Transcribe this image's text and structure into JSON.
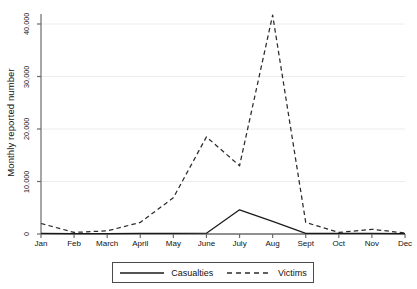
{
  "chart_data": {
    "type": "line",
    "title": "",
    "xlabel": "",
    "ylabel": "Monthly reported number",
    "categories": [
      "Jan",
      "Feb",
      "March",
      "April",
      "May",
      "June",
      "July",
      "Aug",
      "Sept",
      "Oct",
      "Nov",
      "Dec"
    ],
    "ylim": [
      0,
      44000
    ],
    "yticks": [
      0,
      10000,
      20000,
      30000,
      40000
    ],
    "ytick_labels": [
      "0",
      "10,000",
      "20,000",
      "30,000",
      "40,000"
    ],
    "grid": true,
    "grid_axis": "y",
    "legend_position": "bottom-center",
    "series": [
      {
        "name": "Casualties",
        "style": "solid",
        "color": "#1a1a1a",
        "values": [
          100,
          80,
          90,
          100,
          120,
          150,
          4600,
          2400,
          120,
          100,
          100,
          90
        ]
      },
      {
        "name": "Victims",
        "style": "dashed",
        "color": "#2b2b2b",
        "values": [
          2000,
          300,
          600,
          2200,
          6900,
          18500,
          13000,
          41700,
          2200,
          300,
          900,
          200
        ]
      }
    ]
  },
  "legend": {
    "items": [
      {
        "label": "Casualties",
        "icon": "solid-line-swatch"
      },
      {
        "label": "Victims",
        "icon": "dashed-line-swatch"
      }
    ]
  },
  "axes": {
    "y_title": "Monthly reported number"
  }
}
